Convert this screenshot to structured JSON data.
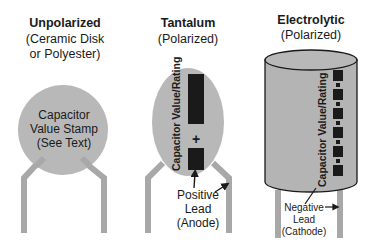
{
  "colors": {
    "body_fill": "#b4b4b4",
    "outline": "#1a1a1a",
    "marking": "#1a1a1a",
    "lead": "#a8a8a8",
    "text": "#1a1a1a"
  },
  "unpolarized": {
    "title": "Unpolarized",
    "subtitle_line1": "(Ceramic Disk",
    "subtitle_line2": "or Polyester)",
    "stamp_line1": "Capacitor",
    "stamp_line2": "Value Stamp",
    "stamp_line3": "(See Text)"
  },
  "tantalum": {
    "title": "Tantalum",
    "subtitle": "(Polarized)",
    "rating_label": "Capacitor Value/Rating",
    "plus_sign": "+",
    "lead_label_line1": "Positive",
    "lead_label_line2": "Lead",
    "lead_label_line3": "(Anode)"
  },
  "electrolytic": {
    "title": "Electrolytic",
    "subtitle": "(Polarized)",
    "rating_label": "Capacitor Value/Rating",
    "lead_label_line1": "Negative",
    "lead_label_line2": "Lead",
    "lead_label_line3": "(Cathode)"
  }
}
